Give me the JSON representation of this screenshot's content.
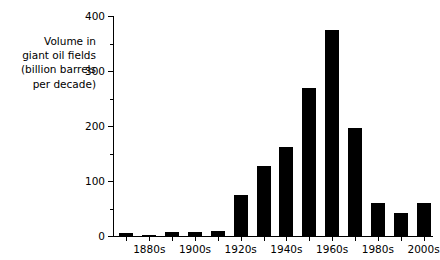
{
  "chart_data": {
    "type": "bar",
    "title": "",
    "subtitle": "",
    "xlabel": "",
    "ylabel": "Volume in giant oil fields (billion barrels per decade)",
    "ylabel_lines": [
      "Volume in",
      "giant oil fields",
      "(billion barrels",
      "per decade)"
    ],
    "ylim": [
      0,
      400
    ],
    "y_major_ticks": [
      0,
      100,
      200,
      300,
      400
    ],
    "y_minor_ticks": [
      50,
      150,
      250,
      350
    ],
    "y_tick_labels": [
      "0",
      "100",
      "200",
      "300",
      "400"
    ],
    "grid": false,
    "legend": null,
    "bar_color": "#000000",
    "background_color": "#ffffff",
    "categories": [
      "1870s",
      "1880s",
      "1890s",
      "1900s",
      "1910s",
      "1920s",
      "1930s",
      "1940s",
      "1950s",
      "1960s",
      "1970s",
      "1980s",
      "1990s",
      "2000s"
    ],
    "visible_tick_labels": [
      "1880s",
      "1900s",
      "1920s",
      "1940s",
      "1960s",
      "1980s",
      "2000s"
    ],
    "values": [
      5,
      2,
      8,
      8,
      9,
      75,
      127,
      161,
      269,
      375,
      196,
      60,
      42,
      60
    ],
    "bars": [
      {
        "category": "1870s",
        "value": 5,
        "labeled": false
      },
      {
        "category": "1880s",
        "value": 2,
        "labeled": true
      },
      {
        "category": "1890s",
        "value": 8,
        "labeled": false
      },
      {
        "category": "1900s",
        "value": 8,
        "labeled": true
      },
      {
        "category": "1910s",
        "value": 9,
        "labeled": false
      },
      {
        "category": "1920s",
        "value": 75,
        "labeled": true
      },
      {
        "category": "1930s",
        "value": 127,
        "labeled": false
      },
      {
        "category": "1940s",
        "value": 161,
        "labeled": true
      },
      {
        "category": "1950s",
        "value": 269,
        "labeled": false
      },
      {
        "category": "1960s",
        "value": 375,
        "labeled": true
      },
      {
        "category": "1970s",
        "value": 196,
        "labeled": false
      },
      {
        "category": "1980s",
        "value": 60,
        "labeled": true
      },
      {
        "category": "1990s",
        "value": 42,
        "labeled": false
      },
      {
        "category": "2000s",
        "value": 60,
        "labeled": true
      }
    ]
  }
}
